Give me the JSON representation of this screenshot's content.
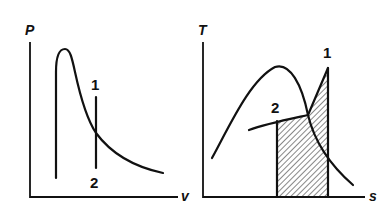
{
  "figure": {
    "left_panel": {
      "name": "P-v diagram",
      "y_axis_label": "P",
      "x_axis_label": "v",
      "points": [
        {
          "label": "1",
          "position": "top of vertical line"
        },
        {
          "label": "2",
          "position": "bottom of vertical line"
        }
      ]
    },
    "right_panel": {
      "name": "T-s diagram",
      "y_axis_label": "T",
      "x_axis_label": "s",
      "points": [
        {
          "label": "1",
          "position": "top of superheated expansion line"
        },
        {
          "label": "2",
          "position": "start of constant-pressure line under dome"
        }
      ],
      "shaded_region": "hatched area under process 2-1"
    },
    "colors": {
      "line": "#111111",
      "background": "#ffffff"
    }
  }
}
